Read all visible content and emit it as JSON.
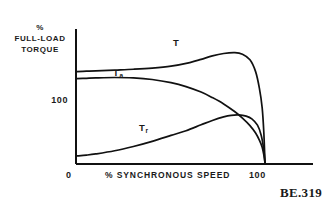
{
  "figure": {
    "caption": "BE.319",
    "axis_color": "#111111",
    "curve_color": "#111111",
    "background": "#ffffff"
  },
  "chart_data": {
    "type": "line",
    "title": "",
    "xlabel": "% SYNCHRONOUS SPEED",
    "ylabel": "% FULL-LOAD TORQUE",
    "ylabel_lines": [
      "%",
      "FULL-LOAD",
      "TORQUE"
    ],
    "xlim": [
      0,
      112
    ],
    "ylim": [
      0,
      330
    ],
    "xticks": [
      0,
      100
    ],
    "xticklabels": [
      "0",
      "100"
    ],
    "yticks": [
      100
    ],
    "yticklabels": [
      "100"
    ],
    "grid": false,
    "legend": "inline-curve-labels",
    "series": [
      {
        "name": "T",
        "label": "T",
        "label_base": "T",
        "label_sub": "",
        "x": [
          0,
          5,
          10,
          20,
          30,
          40,
          50,
          60,
          66,
          72,
          78,
          84,
          88,
          92,
          95,
          97,
          98.5,
          99.4,
          100
        ],
        "y": [
          232,
          233,
          234,
          236,
          238,
          241,
          246,
          255,
          263,
          272,
          278,
          280,
          276,
          262,
          232,
          190,
          140,
          75,
          0
        ]
      },
      {
        "name": "Ta",
        "label": "Ta",
        "label_base": "T",
        "label_sub": "a",
        "x": [
          0,
          5,
          10,
          20,
          30,
          40,
          50,
          58,
          66,
          72,
          78,
          84,
          88,
          92,
          95,
          97,
          98.5,
          99.4,
          100
        ],
        "y": [
          214,
          215,
          216,
          217,
          216,
          212,
          204,
          194,
          180,
          166,
          150,
          130,
          114,
          95,
          76,
          58,
          40,
          20,
          0
        ]
      },
      {
        "name": "Tr",
        "label": "Tr",
        "label_base": "T",
        "label_sub": "r",
        "x": [
          0,
          5,
          10,
          20,
          30,
          40,
          50,
          58,
          66,
          72,
          78,
          82,
          86,
          90,
          93,
          96,
          98,
          99.4,
          100
        ],
        "y": [
          18,
          20,
          23,
          31,
          42,
          55,
          70,
          82,
          97,
          108,
          117,
          121,
          122,
          119,
          112,
          96,
          70,
          32,
          0
        ]
      }
    ]
  }
}
